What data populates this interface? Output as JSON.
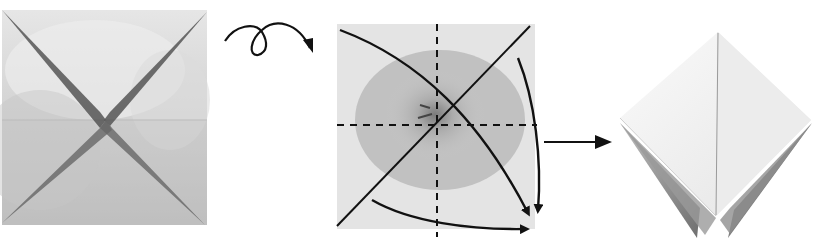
{
  "diagram": {
    "title": "Origami folding sequence",
    "steps": [
      {
        "id": "step-1",
        "description": "Square with creased diagonals (X) and horizontal midline",
        "square": {
          "x": 2,
          "y": 10,
          "w": 205,
          "h": 215
        },
        "paper_color": "#d4d4d4",
        "crease_color": "#4a4a4a"
      },
      {
        "id": "turn-over-symbol",
        "description": "Turn over (loop arrow)",
        "color": "#111111"
      },
      {
        "id": "step-2",
        "description": "Square with dashed valley folds (vertical and horizontal), solid diagonal, and three curved arrows bringing corners to bottom-right",
        "square": {
          "x": 337,
          "y": 24,
          "w": 198,
          "h": 205
        },
        "paper_color": "#e3e3e3",
        "flower_color": "#a8a8a8",
        "line_color": "#111111"
      },
      {
        "id": "arrow-to-result",
        "description": "Straight arrow pointing to result",
        "color": "#111111"
      },
      {
        "id": "step-3",
        "description": "Resulting preliminary base (diamond shape with points at bottom)",
        "paper_color": "#f2f2f2",
        "shadow_color": "#8a8a8a"
      }
    ]
  }
}
